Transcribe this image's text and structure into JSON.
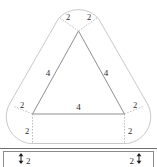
{
  "figure": {
    "shape_name": "rounded-triangle",
    "stroke_colors": {
      "outline": "#c9c9c9",
      "triangle": "#8f8f8f",
      "dashed_radius": "#b0b0b0",
      "arrow": "#1f1f1f",
      "text": "#2b2b2b"
    },
    "triangle": {
      "side_labels": {
        "left": "4",
        "right": "4",
        "bottom": "4"
      }
    },
    "corner_radius_labels": {
      "apex_left": "2",
      "apex_right": "2",
      "bottom_left_diagonal": "2",
      "bottom_left_vertical": "2",
      "bottom_right_diagonal": "2",
      "bottom_right_vertical": "2"
    }
  },
  "bottom_bar": {
    "left_dimension_label": "2",
    "right_dimension_label": "2"
  }
}
